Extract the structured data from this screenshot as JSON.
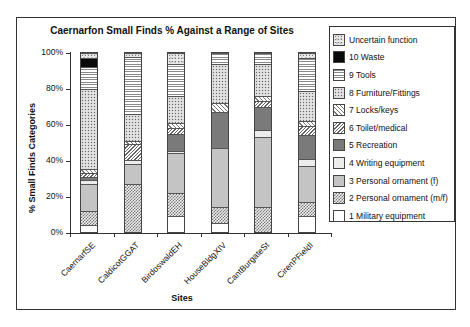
{
  "chart_data": {
    "type": "bar",
    "stacked": true,
    "title": "Caernarfon Small Finds % Against a Range of Sites",
    "xlabel": "Sites",
    "ylabel": "% Small Finds Categories",
    "ylim": [
      0,
      100
    ],
    "yticks": [
      "0%",
      "20%",
      "40%",
      "60%",
      "80%",
      "100%"
    ],
    "categories": [
      "CaernarfSE",
      "CaldicotGGAT",
      "BirdoswaldEH",
      "HouseBldgXIV",
      "CantBurgateSt",
      "CirenPFieldI"
    ],
    "series": [
      {
        "name": "1 Military equipment",
        "key": "military",
        "values": [
          4,
          0,
          9,
          5,
          0,
          9
        ]
      },
      {
        "name": "2 Personal ornament (m/f)",
        "key": "ornmf",
        "values": [
          8,
          27,
          13,
          9,
          14,
          8
        ]
      },
      {
        "name": "3 Personal ornament (f)",
        "key": "ornf",
        "values": [
          15,
          11,
          22,
          33,
          39,
          20
        ]
      },
      {
        "name": "4 Writing equipment",
        "key": "writing",
        "values": [
          2,
          2,
          1,
          0,
          4,
          4
        ]
      },
      {
        "name": "5 Recreation",
        "key": "recreation",
        "values": [
          2,
          0,
          10,
          20,
          13,
          13
        ]
      },
      {
        "name": "6 Toilet/medical",
        "key": "toilet",
        "values": [
          2,
          9,
          3,
          0,
          3,
          5
        ]
      },
      {
        "name": "7 Locks/keys",
        "key": "locks",
        "values": [
          2,
          2,
          3,
          5,
          3,
          3
        ]
      },
      {
        "name": "8 Furniture/Fittings",
        "key": "furniture",
        "values": [
          45,
          15,
          15,
          22,
          18,
          17
        ]
      },
      {
        "name": "9 Tools",
        "key": "tools",
        "values": [
          12,
          32,
          18,
          6,
          6,
          18
        ]
      },
      {
        "name": "10 Waste",
        "key": "waste",
        "values": [
          5,
          0,
          0,
          0,
          0,
          0
        ]
      },
      {
        "name": "Uncertain function",
        "key": "uncertain",
        "values": [
          3,
          2,
          6,
          0,
          0,
          3
        ]
      }
    ],
    "legend_position": "right",
    "grid": false
  },
  "legend": [
    {
      "label": "Uncertain function",
      "key": "uncertain"
    },
    {
      "label": "10 Waste",
      "key": "waste"
    },
    {
      "label": "9 Tools",
      "key": "tools"
    },
    {
      "label": "8 Furniture/Fittings",
      "key": "furniture"
    },
    {
      "label": "7 Locks/keys",
      "key": "locks"
    },
    {
      "label": "6 Toilet/medical",
      "key": "toilet"
    },
    {
      "label": "5 Recreation",
      "key": "recreation"
    },
    {
      "label": "4 Writing equipment",
      "key": "writing"
    },
    {
      "label": "3 Personal ornament (f)",
      "key": "ornf"
    },
    {
      "label": "2 Personal ornament (m/f)",
      "key": "ornmf"
    },
    {
      "label": "1 Military equipment",
      "key": "military"
    }
  ]
}
